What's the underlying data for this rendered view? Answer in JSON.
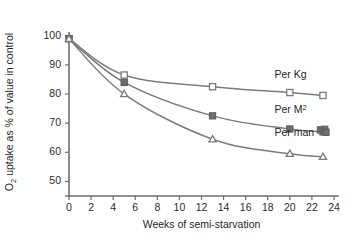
{
  "chart_data": {
    "type": "line",
    "title": "",
    "xlabel": "Weeks of semi-starvation",
    "ylabel": "O2 uptake as % of value in control",
    "ylabel_parts": {
      "pre": "O",
      "sub": "2",
      "post": " uptake as % of value in control"
    },
    "xlim": [
      0,
      24
    ],
    "ylim": [
      45,
      103
    ],
    "xticks": [
      0,
      2,
      4,
      6,
      8,
      10,
      12,
      14,
      16,
      18,
      20,
      22,
      24
    ],
    "yticks": [
      50,
      60,
      70,
      80,
      90,
      100
    ],
    "xtick_labels": [
      "0",
      "2",
      "4",
      "6",
      "8",
      "10",
      "12",
      "14",
      "16",
      "18",
      "20",
      "22",
      "24"
    ],
    "ytick_labels": [
      "50",
      "60",
      "70",
      "80",
      "90",
      "100"
    ],
    "grid": false,
    "legend_position": "inline-right",
    "x": [
      0,
      5,
      13,
      20,
      23
    ],
    "series": [
      {
        "name": "Per Kg",
        "label": "Per Kg",
        "marker": "open-square",
        "color": "#7b7b7b",
        "values": [
          99,
          86.5,
          82.5,
          80.5,
          79.5
        ],
        "label_x": 18.6,
        "label_y": 85.5
      },
      {
        "name": "Per M2",
        "label": "Per M",
        "label_sup": "2",
        "marker": "filled-square",
        "color": "#6f6f6f",
        "values": [
          99,
          84,
          72.5,
          68,
          67
        ],
        "label_x": 18.6,
        "label_y": 73.5,
        "cluster_note": "overlapping markers near week 23"
      },
      {
        "name": "Per man",
        "label": "Per man",
        "marker": "open-triangle",
        "color": "#7b7b7b",
        "values": [
          99,
          80,
          64.5,
          59.5,
          58.5
        ],
        "label_x": 18.6,
        "label_y": 65.5
      }
    ]
  }
}
